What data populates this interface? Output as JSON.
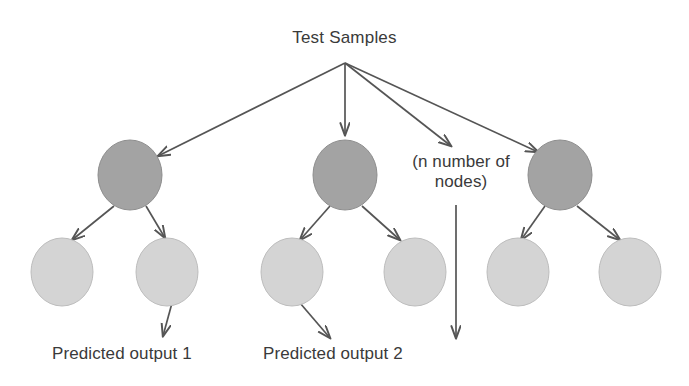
{
  "diagram": {
    "title": "Test Samples",
    "ellipsis_note": "(n number of\nnodes)",
    "outputs": [
      {
        "label": "Predicted output 1"
      },
      {
        "label": "Predicted output 2"
      }
    ],
    "colors": {
      "background": "#ffffff",
      "internal_node_fill": "#a3a3a3",
      "internal_node_stroke": "#8e8e8e",
      "leaf_node_fill": "#d4d4d4",
      "leaf_node_stroke": "#bdbdbd",
      "arrow": "#555555",
      "text": "#3a3a3a"
    },
    "root": {
      "id": "root",
      "x": 345,
      "y": 63,
      "label": "Test Samples"
    },
    "internal_nodes": [
      {
        "id": "node-1",
        "cx": 130,
        "cy": 175,
        "rx": 32,
        "ry": 35
      },
      {
        "id": "node-2",
        "cx": 345,
        "cy": 175,
        "rx": 32,
        "ry": 35
      },
      {
        "id": "node-3",
        "cx": 560,
        "cy": 175,
        "rx": 32,
        "ry": 35
      }
    ],
    "leaf_nodes": [
      {
        "id": "leaf-1",
        "cx": 62,
        "cy": 272,
        "rx": 31,
        "ry": 34
      },
      {
        "id": "leaf-2",
        "cx": 167,
        "cy": 272,
        "rx": 31,
        "ry": 34
      },
      {
        "id": "leaf-3",
        "cx": 292,
        "cy": 272,
        "rx": 31,
        "ry": 34
      },
      {
        "id": "leaf-4",
        "cx": 415,
        "cy": 272,
        "rx": 31,
        "ry": 34
      },
      {
        "id": "leaf-5",
        "cx": 518,
        "cy": 272,
        "rx": 31,
        "ry": 34
      },
      {
        "id": "leaf-6",
        "cx": 630,
        "cy": 272,
        "rx": 31,
        "ry": 34
      }
    ],
    "edges": [
      {
        "id": "root-to-node-1",
        "x1": 345,
        "y1": 63,
        "x2": 158,
        "y2": 156
      },
      {
        "id": "root-to-node-2",
        "x1": 345,
        "y1": 63,
        "x2": 345,
        "y2": 135
      },
      {
        "id": "root-to-ellipsis",
        "x1": 345,
        "y1": 63,
        "x2": 451,
        "y2": 146
      },
      {
        "id": "root-to-node-3",
        "x1": 345,
        "y1": 63,
        "x2": 538,
        "y2": 152
      },
      {
        "id": "node-1-to-leaf-1",
        "x1": 114,
        "y1": 206,
        "x2": 72,
        "y2": 240
      },
      {
        "id": "node-1-to-leaf-2",
        "x1": 146,
        "y1": 206,
        "x2": 165,
        "y2": 238
      },
      {
        "id": "node-2-to-leaf-3",
        "x1": 330,
        "y1": 206,
        "x2": 300,
        "y2": 240
      },
      {
        "id": "node-2-to-leaf-4",
        "x1": 362,
        "y1": 206,
        "x2": 400,
        "y2": 240
      },
      {
        "id": "node-3-to-leaf-5",
        "x1": 545,
        "y1": 206,
        "x2": 521,
        "y2": 240
      },
      {
        "id": "node-3-to-leaf-6",
        "x1": 577,
        "y1": 206,
        "x2": 620,
        "y2": 240
      },
      {
        "id": "leaf-2-to-output-1",
        "x1": 172,
        "y1": 303,
        "x2": 163,
        "y2": 338
      },
      {
        "id": "leaf-3-to-output-2",
        "x1": 300,
        "y1": 303,
        "x2": 330,
        "y2": 340
      },
      {
        "id": "ellipsis-to-output-n",
        "x1": 456,
        "y1": 205,
        "x2": 456,
        "y2": 340
      }
    ]
  }
}
